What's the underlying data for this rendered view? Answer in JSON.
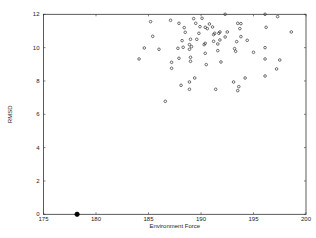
{
  "chart_data": {
    "type": "scatter",
    "title": "",
    "xlabel": "Environment Force",
    "ylabel": "RMSD",
    "xlim": [
      175,
      200
    ],
    "ylim": [
      0,
      12
    ],
    "xticks": [
      175,
      180,
      185,
      190,
      195,
      200
    ],
    "yticks": [
      0,
      2,
      4,
      6,
      8,
      10,
      12
    ],
    "grid": false,
    "legend": null,
    "series": [
      {
        "name": "samples",
        "marker": "open-circle",
        "color": "#333333",
        "points": [
          [
            184.1,
            9.32
          ],
          [
            184.6,
            9.98
          ],
          [
            185.2,
            11.56
          ],
          [
            185.4,
            10.68
          ],
          [
            186.0,
            9.9
          ],
          [
            186.6,
            6.78
          ],
          [
            187.1,
            11.64
          ],
          [
            187.2,
            9.12
          ],
          [
            187.2,
            8.76
          ],
          [
            187.9,
            11.46
          ],
          [
            187.8,
            9.96
          ],
          [
            187.9,
            9.36
          ],
          [
            188.1,
            7.74
          ],
          [
            188.2,
            10.42
          ],
          [
            188.3,
            10.02
          ],
          [
            188.4,
            11.2
          ],
          [
            188.5,
            10.92
          ],
          [
            188.9,
            7.94
          ],
          [
            188.9,
            7.5
          ],
          [
            188.9,
            9.9
          ],
          [
            188.9,
            10.18
          ],
          [
            189.0,
            9.42
          ],
          [
            189.0,
            9.18
          ],
          [
            189.0,
            10.5
          ],
          [
            189.1,
            10.06
          ],
          [
            189.3,
            11.74
          ],
          [
            189.4,
            8.18
          ],
          [
            189.5,
            11.46
          ],
          [
            189.6,
            10.5
          ],
          [
            189.8,
            10.86
          ],
          [
            189.9,
            11.26
          ],
          [
            190.1,
            11.76
          ],
          [
            190.3,
            10.18
          ],
          [
            190.4,
            10.26
          ],
          [
            190.4,
            11.22
          ],
          [
            190.4,
            9.66
          ],
          [
            190.5,
            8.98
          ],
          [
            190.6,
            11.14
          ],
          [
            190.8,
            11.42
          ],
          [
            191.1,
            11.24
          ],
          [
            191.2,
            10.38
          ],
          [
            191.2,
            10.78
          ],
          [
            191.3,
            10.86
          ],
          [
            191.4,
            7.5
          ],
          [
            191.6,
            9.82
          ],
          [
            191.6,
            10.22
          ],
          [
            191.7,
            10.86
          ],
          [
            191.8,
            10.94
          ],
          [
            191.8,
            10.46
          ],
          [
            191.9,
            9.14
          ],
          [
            192.3,
            10.64
          ],
          [
            192.3,
            12.0
          ],
          [
            192.5,
            10.94
          ],
          [
            193.1,
            7.94
          ],
          [
            193.2,
            9.94
          ],
          [
            193.3,
            9.78
          ],
          [
            193.4,
            10.36
          ],
          [
            193.5,
            11.46
          ],
          [
            193.5,
            7.42
          ],
          [
            193.6,
            7.66
          ],
          [
            193.7,
            11.14
          ],
          [
            193.8,
            11.44
          ],
          [
            193.8,
            10.66
          ],
          [
            194.2,
            8.18
          ],
          [
            194.4,
            10.44
          ],
          [
            195.0,
            9.72
          ],
          [
            196.1,
            10.0
          ],
          [
            196.1,
            12.0
          ],
          [
            196.1,
            9.32
          ],
          [
            196.1,
            8.3
          ],
          [
            196.2,
            11.22
          ],
          [
            197.2,
            8.72
          ],
          [
            197.3,
            11.86
          ],
          [
            197.5,
            9.26
          ],
          [
            198.6,
            10.94
          ]
        ]
      },
      {
        "name": "reference",
        "marker": "filled-circle",
        "color": "#000000",
        "points": [
          [
            178.2,
            0.0
          ]
        ]
      }
    ]
  },
  "plot_area": {
    "left": 43.5,
    "top": 14.3,
    "right": 306,
    "bottom": 214.3
  }
}
